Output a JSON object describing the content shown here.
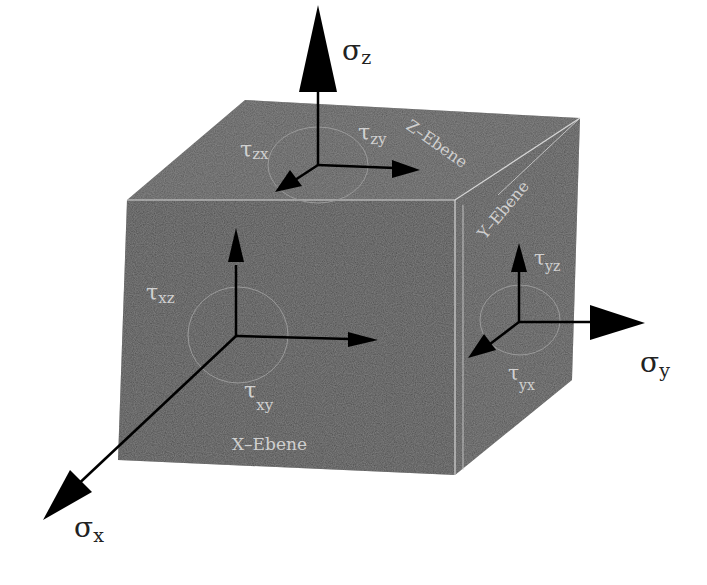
{
  "diagram": {
    "colors": {
      "background": "#ffffff",
      "cube_front": "#4a4a4a",
      "cube_top": "#555555",
      "cube_right": "#4e4e4e",
      "edge_highlight": "#d8d8d8",
      "arrow": "#000000",
      "label_on_cube": "#cfcfcf",
      "label_outside": "#222222"
    },
    "stresses": {
      "sigma_z": {
        "symbol": "σ",
        "sub": "z"
      },
      "sigma_y": {
        "symbol": "σ",
        "sub": "y"
      },
      "sigma_x": {
        "symbol": "σ",
        "sub": "x"
      }
    },
    "shear": {
      "tau_zx": {
        "symbol": "τ",
        "sub": "zx"
      },
      "tau_zy": {
        "symbol": "τ",
        "sub": "zy"
      },
      "tau_xz": {
        "symbol": "τ",
        "sub": "xz"
      },
      "tau_xy": {
        "symbol": "τ",
        "sub": "xy"
      },
      "tau_yz": {
        "symbol": "τ",
        "sub": "yz"
      },
      "tau_yx": {
        "symbol": "τ",
        "sub": "yx"
      }
    },
    "planes": {
      "x": "X–Ebene",
      "y": "Y–Ebene",
      "z": "Z–Ebene"
    }
  }
}
